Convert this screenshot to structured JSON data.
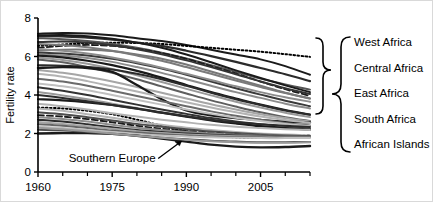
{
  "chart_data": {
    "type": "line",
    "title": "",
    "xlabel": "",
    "ylabel": "Fertility rate",
    "xlim": [
      1960,
      2015
    ],
    "ylim": [
      0,
      8
    ],
    "xticks": [
      1960,
      1975,
      1990,
      2005
    ],
    "xtick_labels": [
      "1960",
      "1975",
      "1990",
      "2005"
    ],
    "xminor_ticks": [
      1965,
      1970,
      1980,
      1985,
      1995,
      2000,
      2010,
      2015
    ],
    "yticks": [
      0,
      2,
      4,
      6,
      8
    ],
    "ytick_labels": [
      "0",
      "2",
      "4",
      "6",
      "8"
    ],
    "grid": false,
    "legend_position": "right",
    "x": [
      1960,
      1965,
      1970,
      1975,
      1980,
      1985,
      1990,
      1995,
      2000,
      2005,
      2010,
      2015
    ],
    "annotations": [
      {
        "text": "Southern Europe",
        "x": 1975,
        "y": 0.75,
        "arrow_to_x": 1989,
        "arrow_to_y": 1.6
      }
    ],
    "legend_bracket": {
      "groups_label": "Region groups",
      "items": [
        "West Africa",
        "Central Africa",
        "East Africa",
        "South Africa",
        "African Islands"
      ]
    },
    "series": [
      {
        "name": "s01",
        "style": "solid",
        "color": "#1a1a1a",
        "width": 2.0,
        "values": [
          7.18,
          7.22,
          7.2,
          7.1,
          6.95,
          6.8,
          6.6,
          6.35,
          6.1,
          5.85,
          5.5,
          5.05
        ]
      },
      {
        "name": "s02",
        "style": "dotted",
        "color": "#000000",
        "width": 2.0,
        "values": [
          6.55,
          6.62,
          6.7,
          6.72,
          6.7,
          6.65,
          6.55,
          6.45,
          6.35,
          6.25,
          6.12,
          5.98
        ]
      },
      {
        "name": "s03",
        "style": "solid",
        "color": "#2b2b2b",
        "width": 2.2,
        "values": [
          7.05,
          7.05,
          6.98,
          6.88,
          6.72,
          6.55,
          6.3,
          6.02,
          5.72,
          5.4,
          5.08,
          4.72
        ]
      },
      {
        "name": "s04",
        "style": "solid",
        "color": "#555555",
        "width": 2.0,
        "values": [
          6.95,
          6.9,
          6.8,
          6.65,
          6.45,
          6.2,
          5.9,
          5.55,
          5.2,
          4.85,
          4.55,
          4.28
        ]
      },
      {
        "name": "s05",
        "style": "dashed",
        "color": "#1a1a1a",
        "width": 1.8,
        "values": [
          6.45,
          6.55,
          6.6,
          6.55,
          6.4,
          6.18,
          5.88,
          5.5,
          5.12,
          4.7,
          4.3,
          3.95
        ]
      },
      {
        "name": "s06",
        "style": "solid",
        "color": "#777777",
        "width": 2.0,
        "values": [
          6.3,
          6.35,
          6.35,
          6.28,
          6.1,
          5.88,
          5.58,
          5.22,
          4.85,
          4.48,
          4.12,
          3.82
        ]
      },
      {
        "name": "s07",
        "style": "solid",
        "color": "#3a3a3a",
        "width": 2.0,
        "values": [
          6.2,
          6.15,
          6.05,
          5.88,
          5.65,
          5.38,
          5.05,
          4.7,
          4.35,
          4.02,
          3.7,
          3.42
        ]
      },
      {
        "name": "s08",
        "style": "solid",
        "color": "#8c8c8c",
        "width": 2.0,
        "values": [
          6.1,
          6.05,
          5.92,
          5.72,
          5.45,
          5.15,
          4.82,
          4.48,
          4.15,
          3.85,
          3.55,
          3.3
        ]
      },
      {
        "name": "s09",
        "style": "solid",
        "color": "#1a1a1a",
        "width": 2.2,
        "values": [
          6.05,
          5.95,
          5.78,
          5.55,
          5.25,
          4.9,
          4.52,
          4.15,
          3.82,
          3.5,
          3.22,
          2.98
        ]
      },
      {
        "name": "s10",
        "style": "solid",
        "color": "#999999",
        "width": 2.0,
        "values": [
          5.95,
          5.82,
          5.62,
          5.35,
          5.02,
          4.68,
          4.32,
          3.98,
          3.65,
          3.35,
          3.08,
          2.85
        ]
      },
      {
        "name": "s11",
        "style": "solid",
        "color": "#5e5e5e",
        "width": 2.0,
        "values": [
          5.85,
          5.7,
          5.45,
          5.15,
          4.82,
          4.45,
          4.08,
          3.72,
          3.4,
          3.1,
          2.85,
          2.65
        ]
      },
      {
        "name": "s12",
        "style": "solid",
        "color": "#2b2b2b",
        "width": 2.0,
        "values": [
          5.55,
          5.52,
          5.45,
          5.32,
          5.1,
          4.82,
          4.48,
          4.12,
          3.78,
          3.48,
          3.2,
          2.98
        ]
      },
      {
        "name": "s13",
        "style": "solid",
        "color": "#a6a6a6",
        "width": 2.0,
        "values": [
          5.3,
          5.15,
          4.95,
          4.7,
          4.42,
          4.12,
          3.82,
          3.52,
          3.25,
          3.0,
          2.8,
          2.62
        ]
      },
      {
        "name": "s14",
        "style": "solid",
        "color": "#1a1a1a",
        "width": 2.4,
        "values": [
          5.4,
          5.45,
          5.4,
          5.2,
          4.52,
          3.78,
          3.2,
          2.95,
          2.8,
          2.7,
          2.62,
          2.58
        ]
      },
      {
        "name": "s15",
        "style": "solid",
        "color": "#b3b3b3",
        "width": 2.0,
        "values": [
          5.1,
          4.95,
          4.72,
          4.45,
          4.18,
          3.9,
          3.62,
          3.35,
          3.1,
          2.88,
          2.7,
          2.55
        ]
      },
      {
        "name": "s16",
        "style": "solid",
        "color": "#6b6b6b",
        "width": 2.0,
        "values": [
          4.85,
          4.7,
          4.48,
          4.22,
          3.95,
          3.68,
          3.42,
          3.15,
          2.92,
          2.72,
          2.55,
          2.42
        ]
      },
      {
        "name": "s17",
        "style": "solid",
        "color": "#c0c0c0",
        "width": 2.0,
        "values": [
          4.6,
          4.45,
          4.25,
          4.0,
          3.75,
          3.5,
          3.25,
          3.02,
          2.82,
          2.65,
          2.5,
          2.38
        ]
      },
      {
        "name": "s18",
        "style": "solid",
        "color": "#333333",
        "width": 2.0,
        "values": [
          4.4,
          4.22,
          4.0,
          3.75,
          3.5,
          3.25,
          3.02,
          2.8,
          2.62,
          2.48,
          2.35,
          2.25
        ]
      },
      {
        "name": "s19",
        "style": "solid",
        "color": "#999999",
        "width": 2.0,
        "values": [
          4.15,
          3.98,
          3.78,
          3.55,
          3.32,
          3.1,
          2.9,
          2.7,
          2.55,
          2.42,
          2.3,
          2.22
        ]
      },
      {
        "name": "s20",
        "style": "solid",
        "color": "#1a1a1a",
        "width": 2.2,
        "values": [
          3.78,
          3.72,
          3.62,
          3.48,
          3.3,
          3.08,
          2.88,
          2.68,
          2.52,
          2.38,
          2.28,
          2.2
        ]
      },
      {
        "name": "s21",
        "style": "dotted",
        "color": "#000000",
        "width": 2.0,
        "values": [
          3.35,
          3.3,
          3.18,
          3.0,
          2.72,
          2.4,
          2.12,
          1.92,
          1.8,
          1.78,
          1.82,
          1.9
        ]
      },
      {
        "name": "s22",
        "style": "solid",
        "color": "#b3b3b3",
        "width": 2.0,
        "values": [
          3.3,
          3.18,
          3.0,
          2.82,
          2.62,
          2.45,
          2.3,
          2.18,
          2.08,
          2.0,
          1.95,
          1.9
        ]
      },
      {
        "name": "s23",
        "style": "solid",
        "color": "#4d4d4d",
        "width": 2.0,
        "values": [
          3.1,
          3.0,
          2.85,
          2.68,
          2.5,
          2.35,
          2.22,
          2.1,
          2.02,
          1.95,
          1.9,
          1.86
        ]
      },
      {
        "name": "s24",
        "style": "dashed",
        "color": "#1a1a1a",
        "width": 1.8,
        "values": [
          2.95,
          2.88,
          2.75,
          2.58,
          2.4,
          2.25,
          2.12,
          2.02,
          1.95,
          1.9,
          1.86,
          1.84
        ]
      },
      {
        "name": "s25",
        "style": "solid",
        "color": "#8c8c8c",
        "width": 2.0,
        "values": [
          2.85,
          2.75,
          2.62,
          2.45,
          2.3,
          2.18,
          2.08,
          2.0,
          1.94,
          1.9,
          1.88,
          1.86
        ]
      },
      {
        "name": "s26",
        "style": "solid",
        "color": "#2b2b2b",
        "width": 2.0,
        "values": [
          2.72,
          2.62,
          2.48,
          2.32,
          2.18,
          2.08,
          2.0,
          1.94,
          1.9,
          1.88,
          1.86,
          1.85
        ]
      },
      {
        "name": "s27",
        "style": "solid",
        "color": "#a6a6a6",
        "width": 2.0,
        "values": [
          2.6,
          2.5,
          2.38,
          2.25,
          2.12,
          2.02,
          1.95,
          1.9,
          1.86,
          1.84,
          1.83,
          1.82
        ]
      },
      {
        "name": "s28",
        "style": "solid",
        "color": "#666666",
        "width": 2.0,
        "values": [
          2.48,
          2.4,
          2.28,
          2.15,
          2.05,
          1.96,
          1.9,
          1.85,
          1.82,
          1.8,
          1.8,
          1.8
        ]
      },
      {
        "name": "s29",
        "style": "solid",
        "color": "#c0c0c0",
        "width": 2.0,
        "values": [
          2.35,
          2.28,
          2.18,
          2.08,
          1.98,
          1.9,
          1.85,
          1.8,
          1.78,
          1.76,
          1.76,
          1.76
        ]
      },
      {
        "name": "s30",
        "style": "solid",
        "color": "#1a1a1a",
        "width": 2.4,
        "values": [
          2.0,
          2.02,
          2.02,
          1.98,
          1.88,
          1.74,
          1.58,
          1.42,
          1.32,
          1.28,
          1.3,
          1.35
        ]
      },
      {
        "name": "s31",
        "style": "solid",
        "color": "#4d4d4d",
        "width": 2.0,
        "values": [
          2.2,
          2.15,
          2.08,
          1.98,
          1.88,
          1.78,
          1.7,
          1.62,
          1.58,
          1.55,
          1.55,
          1.56
        ]
      },
      {
        "name": "s32",
        "style": "solid",
        "color": "#999999",
        "width": 2.0,
        "values": [
          2.3,
          2.22,
          2.12,
          2.0,
          1.88,
          1.78,
          1.68,
          1.6,
          1.55,
          1.52,
          1.52,
          1.54
        ]
      },
      {
        "name": "s33",
        "style": "solid",
        "color": "#333333",
        "width": 2.0,
        "values": [
          6.75,
          6.78,
          6.72,
          6.58,
          6.38,
          6.12,
          5.8,
          5.45,
          5.08,
          4.7,
          4.35,
          4.05
        ]
      },
      {
        "name": "s34",
        "style": "solid",
        "color": "#7a7a7a",
        "width": 2.0,
        "values": [
          6.65,
          6.6,
          6.48,
          6.3,
          6.05,
          5.78,
          5.45,
          5.1,
          4.75,
          4.42,
          4.1,
          3.82
        ]
      },
      {
        "name": "s35",
        "style": "solid",
        "color": "#1a1a1a",
        "width": 2.0,
        "values": [
          7.1,
          7.12,
          7.05,
          6.92,
          6.72,
          6.45,
          6.1,
          5.7,
          5.28,
          4.88,
          4.5,
          4.15
        ]
      },
      {
        "name": "s36",
        "style": "solid",
        "color": "#8c8c8c",
        "width": 2.0,
        "values": [
          6.4,
          6.3,
          6.15,
          5.95,
          5.7,
          5.42,
          5.1,
          4.78,
          4.45,
          4.15,
          3.88,
          3.65
        ]
      },
      {
        "name": "s37",
        "style": "solid",
        "color": "#2b2b2b",
        "width": 2.0,
        "values": [
          4.0,
          3.85,
          3.68,
          3.48,
          3.28,
          3.08,
          2.9,
          2.72,
          2.58,
          2.48,
          2.4,
          2.34
        ]
      },
      {
        "name": "s38",
        "style": "solid",
        "color": "#b3b3b3",
        "width": 2.0,
        "values": [
          3.55,
          3.42,
          3.25,
          3.05,
          2.88,
          2.72,
          2.58,
          2.45,
          2.35,
          2.28,
          2.22,
          2.18
        ]
      }
    ]
  },
  "legend": {
    "items": [
      {
        "label": "West Africa"
      },
      {
        "label": "Central Africa"
      },
      {
        "label": "East Africa"
      },
      {
        "label": "South Africa"
      },
      {
        "label": "African Islands"
      }
    ]
  },
  "yaxis": {
    "title": "Fertility rate"
  }
}
